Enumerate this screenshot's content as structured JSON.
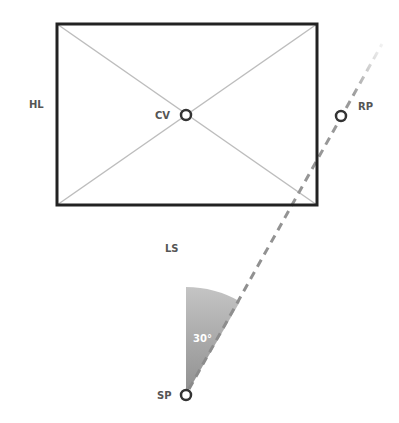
{
  "diagram": {
    "type": "one-point perspective setup",
    "labels": {
      "horizon_line": "HL",
      "center_of_vision": "CV",
      "right_point": "RP",
      "line_of_sight": "LS",
      "station_point": "SP",
      "angle": "30°"
    },
    "points": {
      "CV": {
        "x": 186,
        "y": 115
      },
      "RP": {
        "x": 341,
        "y": 116
      },
      "SP": {
        "x": 186,
        "y": 395
      }
    },
    "picture_plane": {
      "x": 57,
      "y": 24,
      "width": 260,
      "height": 181
    },
    "angle_deg": 30,
    "colors": {
      "frame": "#222222",
      "guide": "#bdbdbd",
      "dashed": "#8a8a8a",
      "wedge": "#a8a8a8",
      "label": "#555555"
    }
  }
}
